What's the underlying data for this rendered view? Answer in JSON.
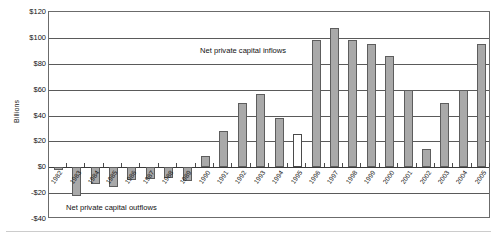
{
  "chart_data": {
    "type": "bar",
    "title": "",
    "xlabel": "",
    "ylabel": "Billions",
    "ylim": [
      -40,
      120
    ],
    "yticks": [
      120,
      100,
      80,
      60,
      40,
      20,
      0,
      -20,
      -40
    ],
    "ytick_labels": [
      "$120",
      "$100",
      "$80",
      "$60",
      "$40",
      "$20",
      "$0",
      "-$20",
      "-$40"
    ],
    "grid": true,
    "legend": "none",
    "categories": [
      "1982",
      "1983",
      "1984",
      "1985",
      "1986",
      "1987",
      "1988",
      "1989",
      "1990",
      "1991",
      "1992",
      "1993",
      "1994",
      "1995",
      "1996",
      "1997",
      "1998",
      "1999",
      "2000",
      "2001",
      "2002",
      "2003",
      "2004",
      "2005"
    ],
    "values": [
      -2,
      -22,
      -13,
      -15,
      -10,
      -9,
      -8,
      -11,
      9,
      28,
      50,
      57,
      38,
      26,
      98,
      108,
      98,
      95,
      86,
      60,
      14,
      50,
      60,
      95
    ],
    "bar_styles": [
      "filled",
      "filled",
      "filled",
      "filled",
      "filled",
      "filled",
      "filled",
      "filled",
      "filled",
      "filled",
      "filled",
      "filled",
      "filled",
      "hollow",
      "filled",
      "filled",
      "filled",
      "filled",
      "filled",
      "filled",
      "filled",
      "filled",
      "filled",
      "filled"
    ],
    "annotations": [
      {
        "id": "inflows",
        "text": "Net private capital inflows"
      },
      {
        "id": "outflows",
        "text": "Net private capital outflows"
      }
    ],
    "colors": {
      "bar_fill": "#a9a9a9",
      "bar_edge": "#5d5d5d",
      "hollow_fill": "#ffffff",
      "gridline": "#5a5a5a",
      "frame": "#6b6b6b",
      "text": "#111111"
    }
  }
}
